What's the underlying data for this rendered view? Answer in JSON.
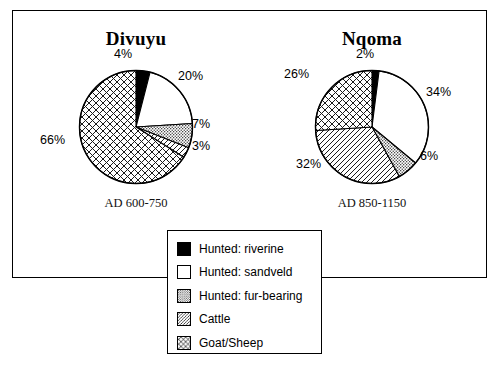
{
  "figure": {
    "frame_color": "#000000",
    "background": "#ffffff"
  },
  "legend": {
    "title": "",
    "items": [
      {
        "label": "Hunted: riverine",
        "pattern": "solid-black",
        "color": "#000000"
      },
      {
        "label": "Hunted: sandveld",
        "pattern": "empty-white",
        "color": "#ffffff"
      },
      {
        "label": "Hunted: fur-bearing",
        "pattern": "stipple-dots",
        "color": "#c8c8c8"
      },
      {
        "label": "Cattle",
        "pattern": "diagonal-hatch",
        "color": "#ffffff"
      },
      {
        "label": "Goat/Sheep",
        "pattern": "cross-hatch",
        "color": "#ffffff"
      }
    ]
  },
  "panels": [
    {
      "id": "divuyu",
      "title": "Divuyu",
      "caption": "AD 600-750",
      "labels": [
        {
          "text": "4%",
          "left": 88,
          "top": 48
        },
        {
          "text": "20%",
          "left": 152,
          "top": 70
        },
        {
          "text": "7%",
          "left": 166,
          "top": 118
        },
        {
          "text": "3%",
          "left": 166,
          "top": 140
        },
        {
          "text": "66%",
          "left": 14,
          "top": 134
        }
      ]
    },
    {
      "id": "nqoma",
      "title": "Nqoma",
      "caption": "AD 850-1150",
      "labels": [
        {
          "text": "2%",
          "left": 94,
          "top": 48
        },
        {
          "text": "34%",
          "left": 164,
          "top": 86
        },
        {
          "text": "6%",
          "left": 158,
          "top": 150
        },
        {
          "text": "32%",
          "left": 34,
          "top": 158
        },
        {
          "text": "26%",
          "left": 22,
          "top": 68
        }
      ]
    }
  ],
  "chart_data": [
    {
      "type": "pie",
      "title": "Divuyu",
      "subtitle": "AD 600-750",
      "categories": [
        "Hunted: riverine",
        "Hunted: sandveld",
        "Hunted: fur-bearing",
        "Cattle",
        "Goat/Sheep"
      ],
      "values": [
        4,
        20,
        7,
        3,
        66
      ],
      "value_labels": [
        "4%",
        "20%",
        "7%",
        "3%",
        "66%"
      ],
      "units": "percent",
      "start_angle": 0,
      "direction": "clockwise",
      "legend_position": "bottom-center",
      "grid": false
    },
    {
      "type": "pie",
      "title": "Nqoma",
      "subtitle": "AD 850-1150",
      "categories": [
        "Hunted: riverine",
        "Hunted: sandveld",
        "Hunted: fur-bearing",
        "Cattle",
        "Goat/Sheep"
      ],
      "values": [
        2,
        34,
        6,
        32,
        26
      ],
      "value_labels": [
        "2%",
        "34%",
        "6%",
        "32%",
        "26%"
      ],
      "units": "percent",
      "start_angle": 0,
      "direction": "clockwise",
      "legend_position": "bottom-center",
      "grid": false
    }
  ]
}
